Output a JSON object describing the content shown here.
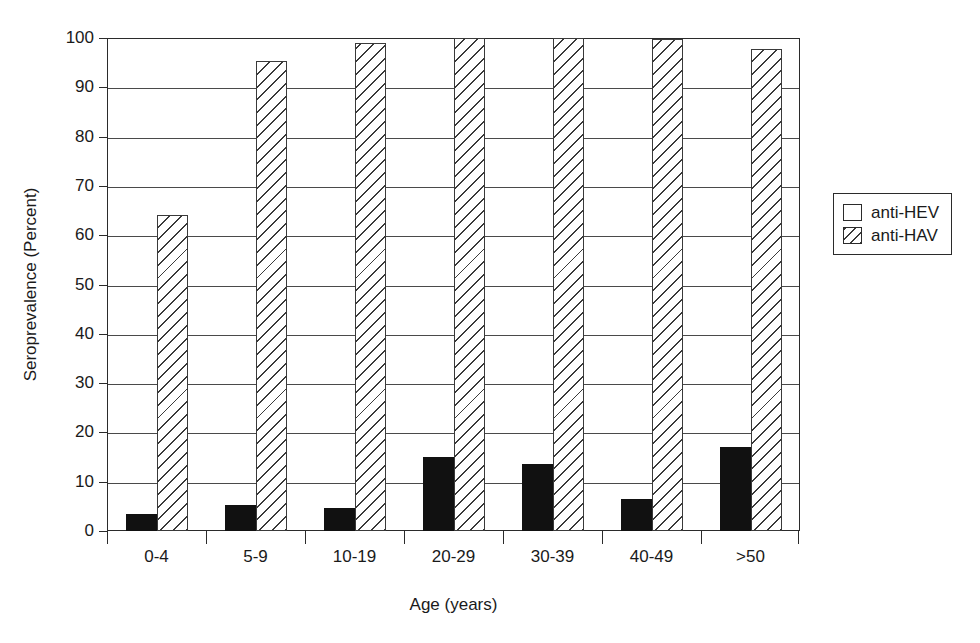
{
  "chart_data": {
    "type": "bar",
    "title": "",
    "xlabel": "Age (years)",
    "ylabel": "Seroprevalence (Percent)",
    "categories": [
      "0-4",
      "5-9",
      "10-19",
      "20-29",
      "30-39",
      "40-49",
      ">50"
    ],
    "series": [
      {
        "name": "anti-HEV",
        "fill": "solid-black",
        "color": "#111111",
        "values": [
          3.4,
          5.2,
          4.6,
          15.0,
          13.5,
          6.5,
          17.0
        ]
      },
      {
        "name": "anti-HAV",
        "fill": "diagonal-hatch",
        "color": "#3a3a3a",
        "values": [
          64.0,
          95.3,
          99.0,
          100.0,
          100.0,
          99.8,
          97.8
        ]
      }
    ],
    "ylim": [
      0,
      100
    ],
    "yticks": [
      0,
      10,
      20,
      30,
      40,
      50,
      60,
      70,
      80,
      90,
      100
    ],
    "ytick_labels": [
      "0",
      "10",
      "20",
      "30",
      "40",
      "50",
      "60",
      "70",
      "80",
      "90",
      "100"
    ],
    "grid": "horizontal",
    "legend_position": "right",
    "legend_entries": [
      "anti-HEV",
      "anti-HAV"
    ]
  },
  "legend": {
    "items": [
      {
        "label": "anti-HEV",
        "swatch": "empty-square-icon"
      },
      {
        "label": "anti-HAV",
        "swatch": "hatched-square-icon"
      }
    ]
  },
  "axes": {
    "x_title": "Age (years)",
    "y_title": "Seroprevalence (Percent)"
  }
}
